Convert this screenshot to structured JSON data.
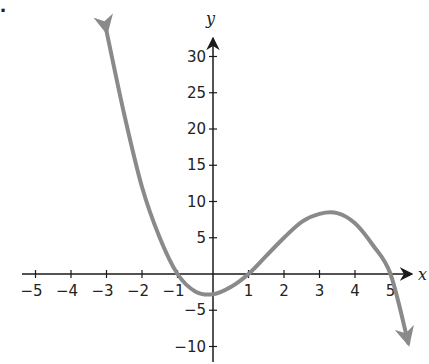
{
  "problem_marker": ".",
  "chart_data": {
    "type": "line",
    "title": "",
    "xlabel": "x",
    "ylabel": "y",
    "xlim": [
      -5.5,
      5.5
    ],
    "ylim": [
      -11,
      33
    ],
    "x_ticks": [
      -5,
      -4,
      -3,
      -2,
      -1,
      1,
      2,
      3,
      4,
      5
    ],
    "x_tick_labels": [
      "−5",
      "−4",
      "−3",
      "−2",
      "−1",
      "1",
      "2",
      "3",
      "4",
      "5"
    ],
    "y_ticks": [
      30,
      25,
      20,
      15,
      10,
      5,
      -5,
      -10
    ],
    "y_tick_labels": [
      "30",
      "25",
      "20",
      "15",
      "10",
      "5",
      "−5",
      "−10"
    ],
    "grid": false,
    "series": [
      {
        "name": "f(x)",
        "color": "#8a8a8a",
        "arrows": "both-ends",
        "x": [
          -3.0,
          -2.5,
          -2.0,
          -1.5,
          -1.0,
          -0.5,
          0.0,
          0.5,
          1.0,
          1.5,
          2.0,
          2.5,
          3.0,
          3.5,
          4.0,
          4.5,
          5.0,
          5.5
        ],
        "y": [
          33.5,
          22.0,
          12.0,
          5.0,
          0.0,
          -2.4,
          -2.8,
          -1.8,
          0.0,
          2.5,
          5.0,
          7.2,
          8.3,
          8.4,
          7.0,
          4.0,
          0.0,
          -9.5
        ]
      }
    ],
    "key_points": {
      "x_intercepts": [
        -1,
        1,
        5
      ],
      "local_min": [
        0,
        -2.8
      ],
      "local_max": [
        3.4,
        8.4
      ]
    }
  }
}
